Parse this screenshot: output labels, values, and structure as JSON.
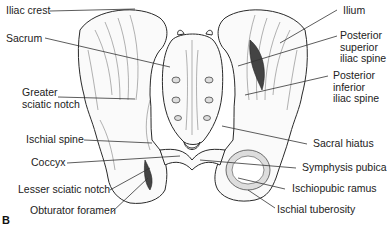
{
  "figure": {
    "panel_label": "B",
    "labels_left": [
      {
        "id": "iliac-crest",
        "lines": [
          "Iliac crest"
        ]
      },
      {
        "id": "sacrum",
        "lines": [
          "Sacrum"
        ]
      },
      {
        "id": "greater-sciatic-notch",
        "lines": [
          "Greater",
          "sciatic notch"
        ]
      },
      {
        "id": "ischial-spine",
        "lines": [
          "Ischial spine"
        ]
      },
      {
        "id": "coccyx",
        "lines": [
          "Coccyx"
        ]
      },
      {
        "id": "lesser-sciatic-notch",
        "lines": [
          "Lesser sciatic notch"
        ]
      },
      {
        "id": "obturator-foramen",
        "lines": [
          "Obturator foramen"
        ]
      }
    ],
    "labels_right": [
      {
        "id": "ilium",
        "lines": [
          "Ilium"
        ]
      },
      {
        "id": "posterior-superior-iliac-spine",
        "lines": [
          "Posterior",
          "superior",
          "iliac spine"
        ]
      },
      {
        "id": "posterior-inferior-iliac-spine",
        "lines": [
          "Posterior",
          "inferior",
          "iliac spine"
        ]
      },
      {
        "id": "sacral-hiatus",
        "lines": [
          "Sacral hiatus"
        ]
      },
      {
        "id": "symphysis-pubica",
        "lines": [
          "Symphysis pubica"
        ]
      },
      {
        "id": "ischiopubic-ramus",
        "lines": [
          "Ischiopubic ramus"
        ]
      },
      {
        "id": "ischial-tuberosity",
        "lines": [
          "Ischial tuberosity"
        ]
      }
    ]
  }
}
